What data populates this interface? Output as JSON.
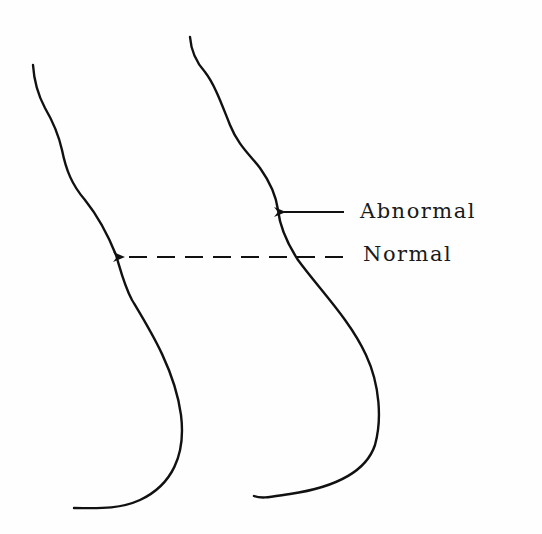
{
  "diagram": {
    "labels": {
      "abnormal": "Abnormal",
      "normal": "Normal"
    },
    "colors": {
      "stroke": "#111111",
      "background": "#fefefe"
    },
    "elements": [
      {
        "id": "curve-normal-profile",
        "type": "curve",
        "description": "Left outline (normal profile)"
      },
      {
        "id": "curve-abnormal-profile",
        "type": "curve",
        "description": "Right outline (abnormal profile)"
      },
      {
        "id": "arrow-abnormal",
        "type": "solid-arrow",
        "points_to": "curve-abnormal-profile",
        "label": "Abnormal"
      },
      {
        "id": "arrow-normal",
        "type": "dashed-arrow",
        "points_to": "curve-normal-profile",
        "label": "Normal"
      }
    ]
  }
}
